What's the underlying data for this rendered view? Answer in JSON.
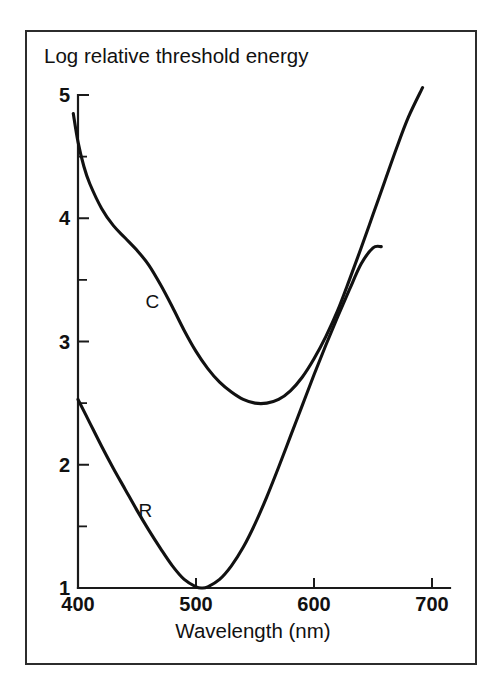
{
  "figure": {
    "frame_color": "#2c2c2c",
    "background": "#ffffff",
    "line_color": "#111111"
  },
  "chart_data": {
    "type": "line",
    "title": "Log relative threshold energy",
    "xlabel": "Wavelength (nm)",
    "ylabel": "Log relative threshold energy",
    "xlim": [
      390,
      710
    ],
    "ylim": [
      1,
      5.2
    ],
    "xticks": [
      400,
      500,
      600,
      700
    ],
    "xtick_labels": [
      "400",
      "500",
      "600",
      "700"
    ],
    "yticks": [
      1,
      2,
      3,
      4,
      5
    ],
    "ytick_labels": [
      "1",
      "2",
      "3",
      "4",
      "5"
    ],
    "yticks_minor": [
      1.5,
      2.5,
      3.5,
      4.5
    ],
    "grid": false,
    "legend": "inline-labels",
    "series": [
      {
        "name": "C",
        "label": "C",
        "label_x": 463,
        "label_y": 3.27,
        "x": [
          396,
          400,
          405,
          410,
          420,
          430,
          440,
          450,
          460,
          470,
          480,
          490,
          500,
          510,
          520,
          530,
          540,
          550,
          560,
          570,
          580,
          590,
          600,
          610,
          620,
          630,
          640,
          650,
          660,
          670,
          680,
          692
        ],
        "y": [
          4.85,
          4.62,
          4.42,
          4.28,
          4.08,
          3.94,
          3.84,
          3.74,
          3.62,
          3.46,
          3.28,
          3.09,
          2.92,
          2.78,
          2.67,
          2.59,
          2.53,
          2.5,
          2.5,
          2.53,
          2.6,
          2.71,
          2.86,
          3.04,
          3.25,
          3.5,
          3.76,
          4.03,
          4.3,
          4.57,
          4.82,
          5.06
        ]
      },
      {
        "name": "R",
        "label": "R",
        "label_x": 457,
        "label_y": 1.58,
        "x": [
          400,
          410,
          420,
          430,
          440,
          450,
          460,
          470,
          480,
          490,
          500,
          505,
          510,
          520,
          530,
          540,
          550,
          560,
          570,
          580,
          590,
          600,
          610,
          620,
          630,
          640,
          650,
          657
        ],
        "y": [
          2.53,
          2.34,
          2.15,
          1.97,
          1.8,
          1.63,
          1.47,
          1.32,
          1.18,
          1.07,
          1.01,
          1.0,
          1.01,
          1.07,
          1.18,
          1.33,
          1.52,
          1.74,
          1.98,
          2.23,
          2.48,
          2.73,
          2.97,
          3.2,
          3.42,
          3.63,
          3.76,
          3.77
        ]
      }
    ]
  }
}
